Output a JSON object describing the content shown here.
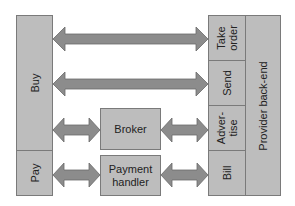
{
  "diagram": {
    "left_column": {
      "buy": "Buy",
      "pay": "Pay"
    },
    "middle": {
      "broker": "Broker",
      "payment_handler_line1": "Payment",
      "payment_handler_line2": "handler"
    },
    "right_column": {
      "take_order_line1": "Take",
      "take_order_line2": "order",
      "send": "Send",
      "advertise_line1": "Adver-",
      "advertise_line2": "tise",
      "bill": "Bill",
      "provider_backend": "Provider back-end"
    },
    "connections": [
      {
        "from": "Buy",
        "to": "Take order",
        "type": "bidirectional"
      },
      {
        "from": "Buy",
        "to": "Send",
        "type": "bidirectional"
      },
      {
        "from": "Buy",
        "to": "Broker",
        "type": "bidirectional"
      },
      {
        "from": "Broker",
        "to": "Advertise",
        "type": "bidirectional"
      },
      {
        "from": "Pay",
        "to": "Payment handler",
        "type": "bidirectional"
      },
      {
        "from": "Payment handler",
        "to": "Bill",
        "type": "bidirectional"
      }
    ],
    "colors": {
      "box_fill": "#bdbdbd",
      "box_border": "#7a7a7a",
      "arrow_fill": "#8c8c8c",
      "arrow_stroke": "#6a6a6a"
    }
  }
}
